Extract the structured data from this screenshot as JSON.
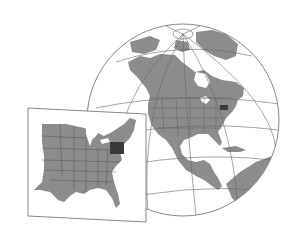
{
  "figure": {
    "type": "locator-map",
    "globe": {
      "region": "North America",
      "projection": "orthographic",
      "graticule": true
    },
    "inset": {
      "region": "Eastern United States"
    },
    "highlight": {
      "state": "Pennsylvania"
    }
  },
  "colors": {
    "background": "#ffffff",
    "land": "#8c8c8c",
    "land_border": "#555555",
    "ocean": "#ffffff",
    "graticule": "#6a6a6a",
    "highlight": "#3a3a3a",
    "frame": "#6a6a6a"
  }
}
